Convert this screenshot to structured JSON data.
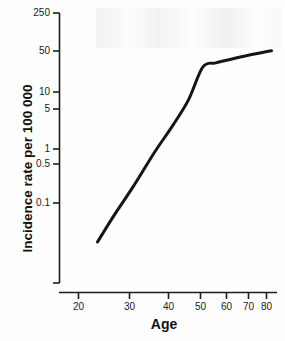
{
  "chart_data": {
    "type": "line",
    "title": "",
    "xlabel": "Age",
    "ylabel": "Incidence rate per 100 000",
    "xscale": "log",
    "yscale": "log",
    "xlim": [
      19,
      88
    ],
    "ylim": [
      0.012,
      250
    ],
    "grid": false,
    "legend": null,
    "xticks": [
      20,
      30,
      40,
      50,
      60,
      70,
      80
    ],
    "xticklabels": [
      "20",
      "30",
      "40",
      "50",
      "60",
      "70",
      "80"
    ],
    "yticks": [
      250,
      50,
      10,
      5,
      1,
      0.5,
      0.1
    ],
    "yticklabels": [
      "250",
      "50",
      "10",
      "5",
      "1",
      "0.5",
      "0.1"
    ],
    "series": [
      {
        "name": "Incidence rate",
        "color": "#151515",
        "linewidth": 3,
        "x": [
          23,
          26,
          30,
          35,
          40,
          45,
          50,
          55,
          60,
          70,
          83
        ],
        "y": [
          0.02,
          0.06,
          0.2,
          0.8,
          2.4,
          7.0,
          27.0,
          32.0,
          36.0,
          44.0,
          53.0
        ]
      }
    ],
    "annotations": []
  },
  "axes": {
    "y_axis_name": "y-axis-spine",
    "x_axis_name": "x-axis-spine"
  }
}
